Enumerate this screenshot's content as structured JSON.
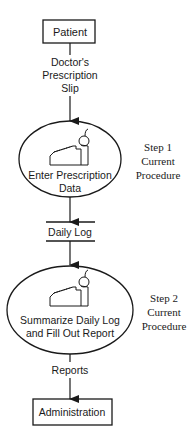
{
  "diagram": {
    "type": "flowchart",
    "colors": {
      "stroke": "#1a1a1a",
      "background": "#ffffff"
    },
    "nodes": {
      "patient": {
        "label": "Patient",
        "shape": "rectangle"
      },
      "enter_data": {
        "label_line1": "Enter Prescription",
        "label_line2": "Data",
        "shape": "ellipse",
        "icon": "cash-register-icon"
      },
      "daily_log": {
        "label": "Daily Log",
        "shape": "data-store"
      },
      "summarize": {
        "label_line1": "Summarize Daily Log",
        "label_line2": "and Fill Out Report",
        "shape": "ellipse",
        "icon": "cash-register-icon"
      },
      "administration": {
        "label": "Administration",
        "shape": "rectangle"
      }
    },
    "flows": {
      "prescription": {
        "line1": "Doctor's",
        "line2": "Prescription",
        "line3": "Slip"
      },
      "reports": {
        "label": "Reports"
      }
    },
    "annotations": {
      "step1": {
        "line1": "Step 1",
        "line2": "Current",
        "line3": "Procedure"
      },
      "step2": {
        "line1": "Step 2",
        "line2": "Current",
        "line3": "Procedure"
      }
    }
  }
}
